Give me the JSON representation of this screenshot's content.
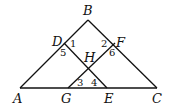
{
  "diagram": {
    "type": "geometry",
    "points": {
      "A": {
        "label": "A",
        "x": 20,
        "y": 88
      },
      "B": {
        "label": "B",
        "x": 88,
        "y": 20
      },
      "C": {
        "label": "C",
        "x": 157,
        "y": 88
      },
      "D": {
        "label": "D",
        "x": 64,
        "y": 43
      },
      "F": {
        "label": "F",
        "x": 115,
        "y": 43
      },
      "G": {
        "label": "G",
        "x": 68,
        "y": 88
      },
      "E": {
        "label": "E",
        "x": 107,
        "y": 88
      },
      "H": {
        "label": "H",
        "x": 88,
        "y": 67
      }
    },
    "segments": [
      [
        "A",
        "B"
      ],
      [
        "B",
        "C"
      ],
      [
        "A",
        "C"
      ],
      [
        "D",
        "E"
      ],
      [
        "F",
        "G"
      ]
    ],
    "angle_labels": [
      "1",
      "2",
      "3",
      "4",
      "5",
      "6"
    ]
  }
}
